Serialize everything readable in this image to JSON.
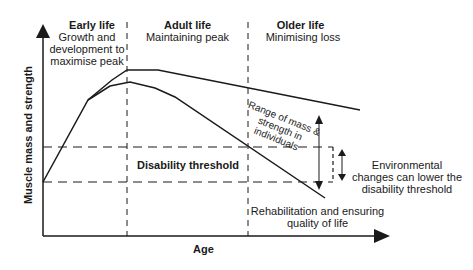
{
  "diagram": {
    "axes": {
      "y_label": "Muscle mass and strength",
      "x_label": "Age"
    },
    "phases": [
      {
        "title": "Early life",
        "subtitle_lines": [
          "Growth and",
          "development to",
          "maximise peak"
        ]
      },
      {
        "title": "Adult life",
        "subtitle_lines": [
          "Maintaining peak"
        ]
      },
      {
        "title": "Older life",
        "subtitle_lines": [
          "Minimising loss"
        ]
      }
    ],
    "annotations": {
      "disability_threshold": "Disability threshold",
      "range_lines": [
        "Range of mass &",
        "strength in",
        "individuals"
      ],
      "environmental_lines": [
        "Environmental",
        "changes can lower the",
        "disability threshold"
      ],
      "rehabilitation_lines": [
        "Rehabilitation and ensuring",
        "quality of life"
      ]
    },
    "colors": {
      "line": "#1a1a1a",
      "background": "#ffffff"
    }
  }
}
